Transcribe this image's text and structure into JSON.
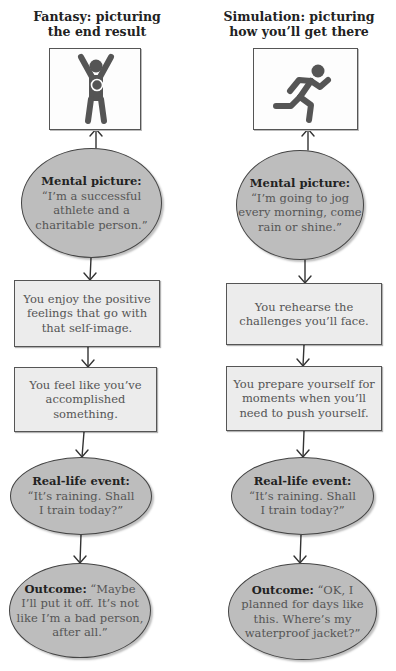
{
  "columns": [
    {
      "id": "fantasy",
      "title_line1": "Fantasy: picturing",
      "title_line2": "the end result",
      "image_icon": "person-arms-raised-with-medal-icon",
      "mental_picture": {
        "label": "Mental picture:",
        "line1": "“I’m a successful",
        "line2": "athlete and a",
        "line3": "charitable person.”"
      },
      "step1": {
        "line1": "You enjoy the positive",
        "line2": "feelings that go with",
        "line3": "that self-image."
      },
      "step2": {
        "line1": "You feel like you’ve",
        "line2": "accomplished",
        "line3": "something."
      },
      "event": {
        "label": "Real-life event:",
        "line1": "“It’s raining. Shall",
        "line2": "I train today?”"
      },
      "outcome": {
        "label": "Outcome:",
        "line1_rest": " “Maybe",
        "line2": "I’ll put it off. It’s not",
        "line3": "like I’m a bad person,",
        "line4": "after all.”"
      }
    },
    {
      "id": "simulation",
      "title_line1": "Simulation: picturing",
      "title_line2": "how you’ll get there",
      "image_icon": "running-person-icon",
      "mental_picture": {
        "label": "Mental picture:",
        "line1": "“I’m going to jog",
        "line2": "every morning, come",
        "line3": "rain or shine.”"
      },
      "step1": {
        "line1": "You rehearse the",
        "line2": "challenges you’ll face."
      },
      "step2": {
        "line1": "You prepare yourself for",
        "line2": "moments when you’ll",
        "line3": "need to push yourself."
      },
      "event": {
        "label": "Real-life event:",
        "line1": "“It’s raining. Shall",
        "line2": "I train today?”"
      },
      "outcome": {
        "label": "Outcome:",
        "line1_rest": " “OK, I",
        "line2": "planned for days like",
        "line3": "this. Where’s my",
        "line4": "waterproof jacket?”"
      }
    }
  ],
  "colors": {
    "ellipse_fill": "#bdbdbd",
    "rect_fill": "#ececec",
    "stroke": "#444444",
    "figure": "#555555"
  }
}
